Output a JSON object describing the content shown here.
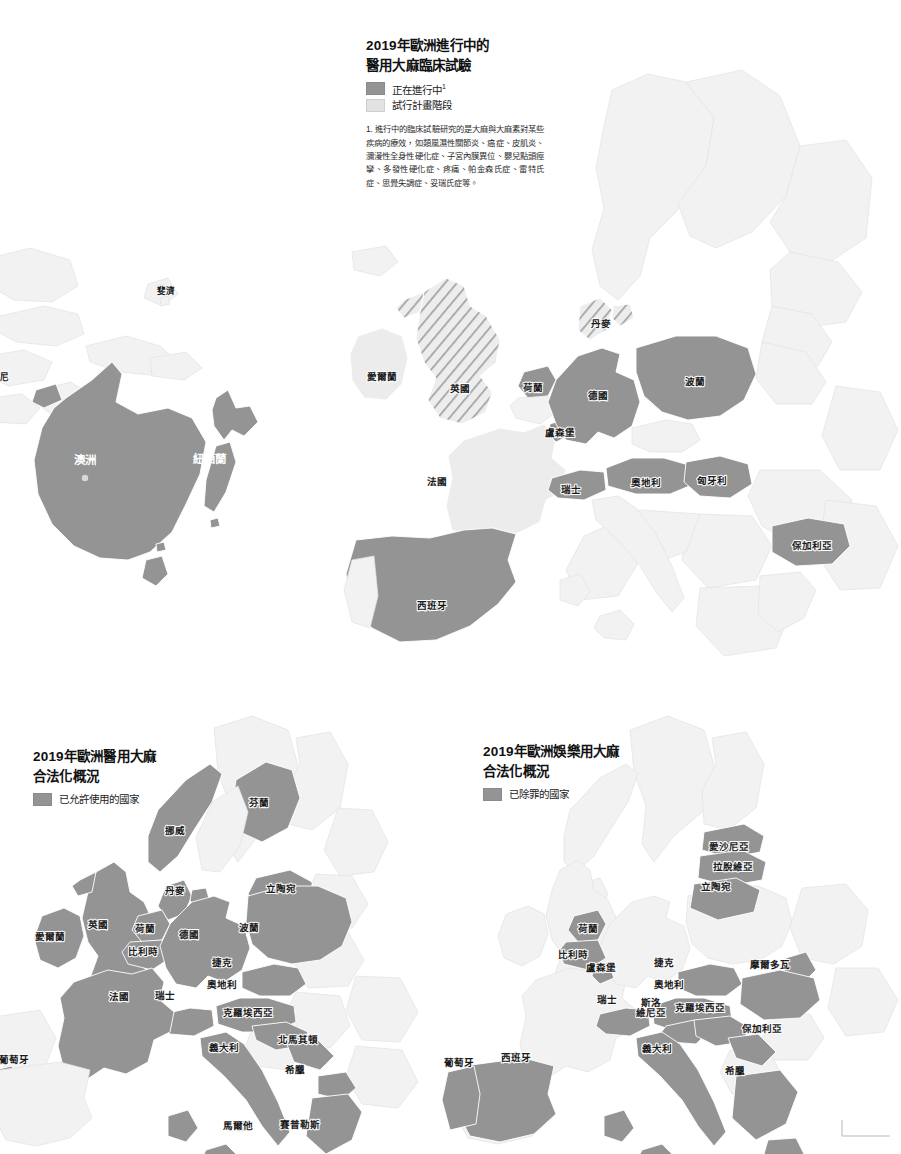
{
  "page": {
    "background": "#ffffff",
    "width": 901,
    "height": 1154
  },
  "colors": {
    "dark_fill": "#949494",
    "light_fill": "#ececed",
    "faint_fill": "#f2f2f3",
    "hatch_stroke": "#9a9a9a",
    "label_text": "#1a1a1a",
    "border": "#ffffff"
  },
  "main_map": {
    "title": "2019年歐洲進行中的\n醫用大麻臨床試驗",
    "legend": [
      {
        "label": "正在進行中",
        "marker": "1",
        "style": "dark",
        "swatch": "#949494"
      },
      {
        "label": "試行計畫階段",
        "marker": "",
        "style": "light",
        "swatch": "#e2e2e3"
      }
    ],
    "footnote": "1. 進行中的臨床試驗研究的是大麻與大麻素對某些疾病的療效，如類風濕性關節炎、癌症、皮肌炎、瀰漫性全身性硬化症、子宮內膜異位、嬰兒點頭痙攣、多發性硬化症、疼痛、帕金森氏症、雷特氏症、思覺失調症、妥瑞氏症等。",
    "labels": [
      {
        "name": "愛爾蘭",
        "x": 382,
        "y": 377,
        "style": "light"
      },
      {
        "name": "英國",
        "x": 460,
        "y": 389,
        "style": "hatch"
      },
      {
        "name": "丹麥",
        "x": 601,
        "y": 324,
        "style": "hatch"
      },
      {
        "name": "荷蘭",
        "x": 533,
        "y": 388,
        "style": "dark"
      },
      {
        "name": "德國",
        "x": 598,
        "y": 396,
        "style": "dark"
      },
      {
        "name": "波蘭",
        "x": 695,
        "y": 382,
        "style": "dark"
      },
      {
        "name": "盧森堡",
        "x": 560,
        "y": 433,
        "style": "dark"
      },
      {
        "name": "法國",
        "x": 437,
        "y": 482,
        "style": "light"
      },
      {
        "name": "瑞士",
        "x": 571,
        "y": 490,
        "style": "dark"
      },
      {
        "name": "奧地利",
        "x": 646,
        "y": 483,
        "style": "dark"
      },
      {
        "name": "匈牙利",
        "x": 712,
        "y": 481,
        "style": "dark"
      },
      {
        "name": "保加利亞",
        "x": 812,
        "y": 546,
        "style": "dark"
      },
      {
        "name": "西班牙",
        "x": 432,
        "y": 606,
        "style": "dark"
      }
    ]
  },
  "oceania_map": {
    "labels": [
      {
        "name": "斐濟",
        "x": 166,
        "y": 292,
        "style": "light",
        "size": "sm"
      },
      {
        "name": "尼",
        "x": 4,
        "y": 378,
        "style": "light",
        "size": "sm"
      },
      {
        "name": "澳洲",
        "x": 85,
        "y": 461,
        "style": "dark",
        "size": "big"
      },
      {
        "name": "紐西蘭",
        "x": 209,
        "y": 460,
        "style": "dark",
        "size": "big"
      }
    ],
    "city_dot": {
      "x": 85,
      "y": 478
    }
  },
  "medical_map": {
    "title": "2019年歐洲醫用大麻\n合法化概況",
    "legend": [
      {
        "label": "已允許使用的國家",
        "marker": "",
        "style": "dark",
        "swatch": "#949494"
      }
    ],
    "labels": [
      {
        "name": "芬蘭",
        "x": 259,
        "y": 803
      },
      {
        "name": "挪威",
        "x": 175,
        "y": 831
      },
      {
        "name": "丹麥",
        "x": 175,
        "y": 891
      },
      {
        "name": "立陶宛",
        "x": 281,
        "y": 889
      },
      {
        "name": "英國",
        "x": 98,
        "y": 925
      },
      {
        "name": "愛爾蘭",
        "x": 50,
        "y": 937
      },
      {
        "name": "荷蘭",
        "x": 145,
        "y": 929
      },
      {
        "name": "比利時",
        "x": 143,
        "y": 952
      },
      {
        "name": "德國",
        "x": 189,
        "y": 935
      },
      {
        "name": "波蘭",
        "x": 249,
        "y": 928
      },
      {
        "name": "捷克",
        "x": 222,
        "y": 963
      },
      {
        "name": "奧地利",
        "x": 222,
        "y": 985
      },
      {
        "name": "瑞士",
        "x": 165,
        "y": 996
      },
      {
        "name": "法國",
        "x": 119,
        "y": 997
      },
      {
        "name": "克羅埃西亞",
        "x": 248,
        "y": 1013
      },
      {
        "name": "北馬其頓",
        "x": 298,
        "y": 1040
      },
      {
        "name": "義大利",
        "x": 224,
        "y": 1048
      },
      {
        "name": "希臘",
        "x": 295,
        "y": 1070
      },
      {
        "name": "葡萄牙",
        "x": 14,
        "y": 1060
      },
      {
        "name": "馬爾他",
        "x": 238,
        "y": 1126
      },
      {
        "name": "賽普勒斯",
        "x": 300,
        "y": 1125
      }
    ]
  },
  "recreational_map": {
    "title": "2019年歐洲娛樂用大麻\n合法化概況",
    "legend": [
      {
        "label": "已除罪的國家",
        "marker": "",
        "style": "dark",
        "swatch": "#949494"
      }
    ],
    "labels": [
      {
        "name": "愛沙尼亞",
        "x": 729,
        "y": 847
      },
      {
        "name": "拉脫維亞",
        "x": 733,
        "y": 867
      },
      {
        "name": "立陶宛",
        "x": 716,
        "y": 887
      },
      {
        "name": "荷蘭",
        "x": 588,
        "y": 929
      },
      {
        "name": "比利時",
        "x": 573,
        "y": 955
      },
      {
        "name": "盧森堡",
        "x": 601,
        "y": 968
      },
      {
        "name": "捷克",
        "x": 664,
        "y": 963
      },
      {
        "name": "摩爾多瓦",
        "x": 770,
        "y": 965
      },
      {
        "name": "奧地利",
        "x": 669,
        "y": 985
      },
      {
        "name": "瑞士",
        "x": 607,
        "y": 1000
      },
      {
        "name": "斯洛",
        "x": 651,
        "y": 1003
      },
      {
        "name": "維尼亞",
        "x": 651,
        "y": 1013
      },
      {
        "name": "克羅埃西亞",
        "x": 700,
        "y": 1008
      },
      {
        "name": "保加利亞",
        "x": 762,
        "y": 1029
      },
      {
        "name": "義大利",
        "x": 657,
        "y": 1049
      },
      {
        "name": "希臘",
        "x": 735,
        "y": 1071
      },
      {
        "name": "西班牙",
        "x": 516,
        "y": 1058
      },
      {
        "name": "葡萄牙",
        "x": 459,
        "y": 1063
      }
    ]
  }
}
